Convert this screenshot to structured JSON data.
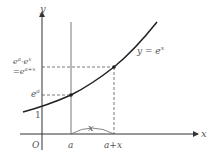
{
  "diagram": {
    "axes": {
      "x_label": "x",
      "y_label": "y",
      "origin_label": "O"
    },
    "curve_label": "y = e^x",
    "curve_label_parts": {
      "lhs": "y",
      "eq": " = ",
      "base": "e",
      "exp": "x"
    },
    "x_ticks": {
      "a": "a",
      "a_plus_x": "a+x"
    },
    "y_ticks": {
      "one": "1",
      "ea_base": "e",
      "ea_exp": "a",
      "prod_line1_base1": "e",
      "prod_line1_exp1": "a",
      "prod_line1_dot": "·",
      "prod_line1_base2": "e",
      "prod_line1_exp2": "x",
      "prod_line2_eq": "=",
      "prod_line2_base": "e",
      "prod_line2_exp": "a+x"
    },
    "interval_label": "x",
    "colors": {
      "axis": "#333333",
      "curve": "#222222",
      "dashed": "#555555",
      "text": "#555555"
    }
  }
}
